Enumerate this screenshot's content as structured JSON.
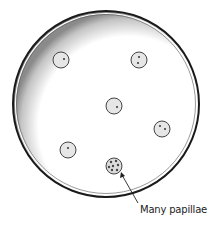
{
  "figure": {
    "dish": {
      "cx": 106,
      "cy": 104,
      "r": 93,
      "rim_color": "#1a1a1a",
      "shade_color": "#8a8a8a"
    },
    "colony_fill": "#e6e6e6",
    "colony_stroke": "#444444",
    "colonies": [
      {
        "cx": 61,
        "cy": 60,
        "r": 8,
        "papillae": 1
      },
      {
        "cx": 139,
        "cy": 60,
        "r": 8,
        "papillae": 2
      },
      {
        "cx": 114,
        "cy": 106,
        "r": 8,
        "papillae": 1
      },
      {
        "cx": 162,
        "cy": 129,
        "r": 8,
        "papillae": 2
      },
      {
        "cx": 68,
        "cy": 150,
        "r": 8,
        "papillae": 1
      },
      {
        "cx": 114,
        "cy": 166,
        "r": 8,
        "papillae": "many"
      }
    ],
    "annotation": {
      "text": "Many papillae",
      "arrow_from": [
        138,
        203
      ],
      "arrow_to": [
        121,
        173
      ]
    }
  }
}
